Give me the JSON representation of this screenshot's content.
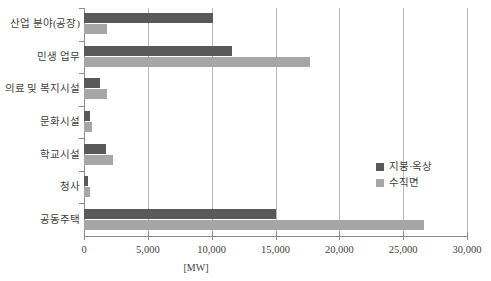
{
  "chart_data": {
    "type": "bar",
    "orientation": "horizontal",
    "title": "",
    "xlabel": "[MW]",
    "ylabel": "",
    "xlim": [
      0,
      30000
    ],
    "xticks": [
      0,
      5000,
      10000,
      15000,
      20000,
      25000,
      30000
    ],
    "xtick_labels": [
      "0",
      "5,000",
      "10,000",
      "15,000",
      "20,000",
      "25,000",
      "30,000"
    ],
    "grid": true,
    "legend_position": "right-inside",
    "categories": [
      "산업 분야(공장)",
      "민생 업무",
      "의료 및 복지시설",
      "문화시설",
      "학교시설",
      "청사",
      "공동주택"
    ],
    "series": [
      {
        "name": "지붕·옥상",
        "color": "#595959",
        "values": [
          10100,
          11600,
          1250,
          450,
          1750,
          350,
          15000
        ]
      },
      {
        "name": "수직면",
        "color": "#a6a6a6",
        "values": [
          1800,
          17700,
          1800,
          620,
          2300,
          500,
          26600
        ]
      }
    ]
  },
  "axis": {
    "unit_label": "[MW]"
  },
  "legend": {
    "entries": [
      {
        "label": "지붕·옥상",
        "swatch": "series-dark"
      },
      {
        "label": "수직면",
        "swatch": "series-light"
      }
    ]
  },
  "colors": {
    "series_dark": "#595959",
    "series_light": "#a6a6a6",
    "gridline": "#b9b9b9",
    "axis": "#8a8a8a",
    "text": "#3f3f3f",
    "background": "#ffffff"
  }
}
